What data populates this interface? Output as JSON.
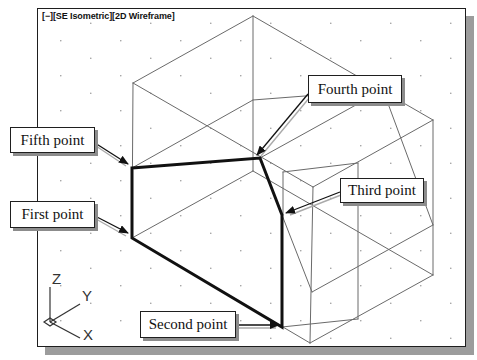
{
  "viewport": {
    "controls": {
      "menu": "[−]",
      "view": "[SE Isometric]",
      "visual_style": "[2D Wireframe]"
    }
  },
  "callouts": {
    "fifth": "Fifth point",
    "first": "First point",
    "fourth": "Fourth point",
    "third": "Third point",
    "second": "Second point"
  },
  "ucs_icon": {
    "z": "Z",
    "y": "Y",
    "x": "X"
  },
  "colors": {
    "wireframe": "#6a6a6a",
    "selected_outline": "#111111",
    "grid_dots": "#8a8a8a",
    "frame_shadow": "#9c9c9c"
  }
}
